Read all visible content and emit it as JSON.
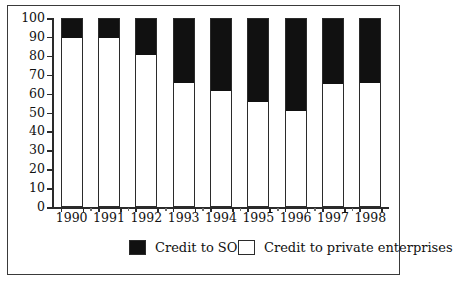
{
  "chart_data": {
    "type": "bar",
    "subtype": "stacked-100-percent",
    "title": "",
    "subtitle": "",
    "xlabel": "",
    "ylabel": "",
    "categories": [
      "1990",
      "1991",
      "1992",
      "1993",
      "1994",
      "1995",
      "1996",
      "1997",
      "1998"
    ],
    "series": [
      {
        "name": "Credit to private enterprises",
        "color": "#ffffff",
        "stack_position": "bottom",
        "values": [
          90,
          90,
          81,
          66,
          62,
          56,
          51.5,
          65.5,
          66
        ]
      },
      {
        "name": "Credit to SOEs",
        "color": "#111111",
        "stack_position": "top",
        "values": [
          10,
          10,
          19,
          34,
          38,
          44,
          48.5,
          34.5,
          34
        ]
      }
    ],
    "ylim": [
      0,
      100
    ],
    "ytick_values": [
      0,
      10,
      20,
      30,
      40,
      50,
      60,
      70,
      80,
      90,
      100
    ],
    "ytick_labels": [
      "0",
      "10",
      "20",
      "30",
      "40",
      "50",
      "60",
      "70",
      "80",
      "90",
      "100"
    ],
    "grid": false,
    "legend_position": "bottom",
    "legend": [
      {
        "label": "Credit to SOEs",
        "swatch": "black"
      },
      {
        "label": "Credit to private enterprises",
        "swatch": "white"
      }
    ]
  },
  "axes": {
    "y": {
      "ticks": [
        {
          "value": 100,
          "label": "100"
        },
        {
          "value": 90,
          "label": "90"
        },
        {
          "value": 80,
          "label": "80"
        },
        {
          "value": 70,
          "label": "70"
        },
        {
          "value": 60,
          "label": "60"
        },
        {
          "value": 50,
          "label": "50"
        },
        {
          "value": 40,
          "label": "40"
        },
        {
          "value": 30,
          "label": "30"
        },
        {
          "value": 20,
          "label": "20"
        },
        {
          "value": 10,
          "label": "10"
        },
        {
          "value": 0,
          "label": "0"
        }
      ]
    },
    "x": {
      "ticks": [
        "1990",
        "1991",
        "1992",
        "1993",
        "1994",
        "1995",
        "1996",
        "1997",
        "1998"
      ]
    }
  },
  "legend": {
    "items": [
      {
        "label": "Credit to SOEs",
        "swatch": "black"
      },
      {
        "label": "Credit to private enterprises",
        "swatch": "white"
      }
    ]
  },
  "style": {
    "bar_border_color": "#2b2b2b",
    "soe_color": "#111111",
    "private_color": "#ffffff",
    "frame_color": "#3a3a3a",
    "axis_color": "#2a2a2a"
  }
}
